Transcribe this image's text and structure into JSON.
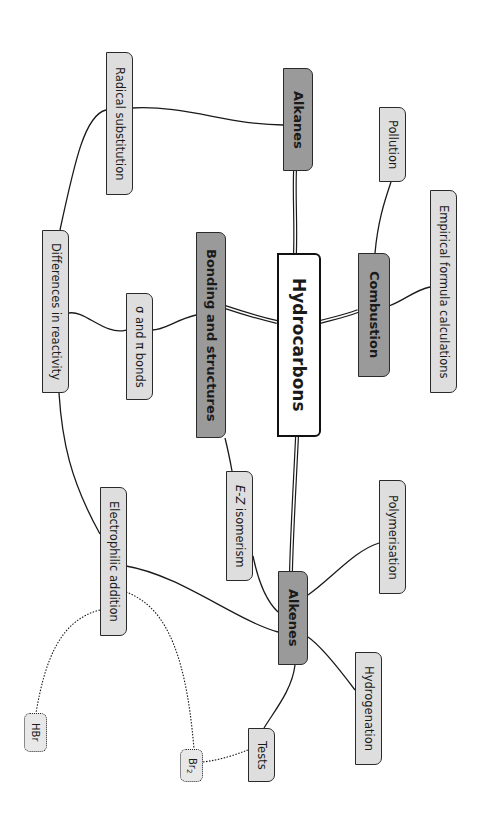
{
  "title": "Hydrocarbons",
  "nodes": {
    "root": "Hydrocarbons",
    "alkanes": "Alkanes",
    "combustion": "Combustion",
    "bonding": "Bonding and structures",
    "alkenes": "Alkenes",
    "radical_substitution": "Radical substitution",
    "pollution": "Pollution",
    "empirical": "Empirical formula calculations",
    "differences": "Differences in reactivity",
    "sigma_pi": "σ and π bonds",
    "ez_prefix": "E-Z",
    "ez_suffix": " isomerism",
    "polymerisation": "Polymerisation",
    "electrophilic": "Electrophilic addition",
    "hydrogenation": "Hydrogenation",
    "tests": "Tests",
    "hbr": "HBr",
    "br2_base": "Br",
    "br2_sub": "2"
  },
  "colors": {
    "branch_fill": "#9a9a9a",
    "leaf_fill": "#dedede",
    "root_fill": "#ffffff",
    "line": "#1a1a1a"
  }
}
